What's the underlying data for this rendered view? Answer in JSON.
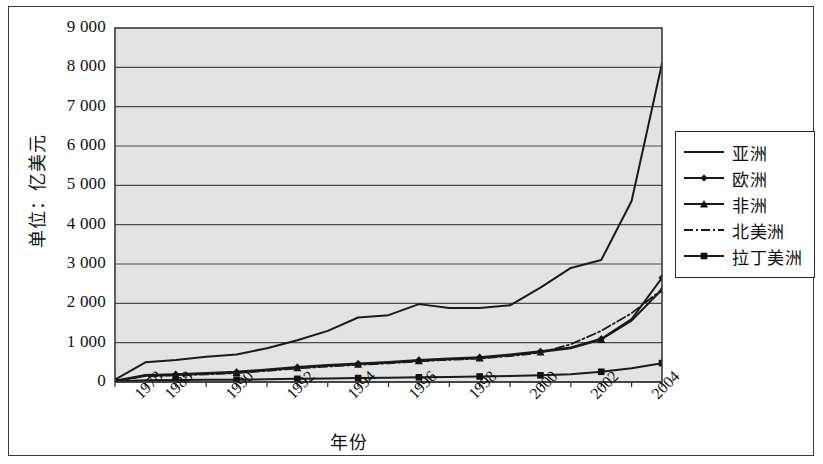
{
  "chart_data": {
    "type": "line",
    "title": "",
    "xlabel": "年份",
    "ylabel": "单位：亿美元",
    "grid": true,
    "legend_position": "right",
    "ylim": [
      0,
      9000
    ],
    "ytick_labels": [
      "9 000",
      "8 000",
      "7 000",
      "6 000",
      "5 000",
      "4 000",
      "3 000",
      "2 000",
      "1 000",
      "0"
    ],
    "ytick_values": [
      9000,
      8000,
      7000,
      6000,
      5000,
      4000,
      3000,
      2000,
      1000,
      0
    ],
    "xtick_labels": [
      "1978",
      "1988",
      "1990",
      "1992",
      "1994",
      "1996",
      "1998",
      "2000",
      "2002",
      "2004"
    ],
    "x": [
      1978,
      1988,
      1989,
      1990,
      1991,
      1992,
      1993,
      1994,
      1995,
      1996,
      1997,
      1998,
      1999,
      2000,
      2001,
      2002,
      2003,
      2004,
      2005
    ],
    "series": [
      {
        "name": "亚洲",
        "marker": "none",
        "line_style": "solid",
        "color": "#1a1a1a",
        "values": [
          60,
          500,
          560,
          640,
          700,
          860,
          1060,
          1300,
          1640,
          1700,
          1980,
          1880,
          1880,
          1950,
          2400,
          2900,
          3100,
          4600,
          8100
        ]
      },
      {
        "name": "欧洲",
        "marker": "diamond",
        "line_style": "solid",
        "color": "#1a1a1a",
        "values": [
          30,
          180,
          200,
          230,
          260,
          320,
          380,
          430,
          470,
          510,
          560,
          600,
          630,
          700,
          780,
          880,
          1100,
          1600,
          2650
        ]
      },
      {
        "name": "非洲",
        "marker": "triangle",
        "line_style": "solid",
        "color": "#1a1a1a",
        "values": [
          25,
          160,
          180,
          210,
          240,
          300,
          360,
          410,
          450,
          490,
          540,
          580,
          610,
          680,
          760,
          860,
          1080,
          1560,
          2350
        ]
      },
      {
        "name": "北美洲",
        "marker": "none",
        "line_style": "dashdot",
        "color": "#1a1a1a",
        "values": [
          20,
          150,
          170,
          195,
          225,
          285,
          345,
          395,
          435,
          475,
          525,
          565,
          595,
          660,
          745,
          960,
          1300,
          1750,
          2350
        ]
      },
      {
        "name": "拉丁美洲",
        "marker": "square",
        "line_style": "solid",
        "color": "#1a1a1a",
        "values": [
          10,
          45,
          50,
          55,
          60,
          70,
          80,
          90,
          100,
          110,
          120,
          130,
          140,
          150,
          170,
          200,
          260,
          350,
          480
        ]
      }
    ]
  },
  "plot": {
    "background": "#e3e3e3",
    "border_color": "#3a3a3a",
    "gridline_color": "#4a4a4a"
  }
}
